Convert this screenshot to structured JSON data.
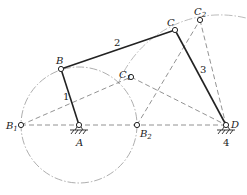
{
  "diagram": {
    "type": "four-bar linkage (crank-rocker) with extreme positions",
    "colors": {
      "link": "#222222",
      "construction": "#888888",
      "circle": "#999999"
    },
    "points": {
      "A": {
        "label": "A",
        "x": 79,
        "y": 125
      },
      "B": {
        "label": "B",
        "x": 61,
        "y": 69
      },
      "B1": {
        "label": "B",
        "sub": "1",
        "x": 21,
        "y": 125
      },
      "B2": {
        "label": "B",
        "sub": "2",
        "x": 137,
        "y": 125
      },
      "C": {
        "label": "C",
        "x": 175,
        "y": 30
      },
      "C1": {
        "label": "C",
        "sub": "1",
        "x": 131,
        "y": 77
      },
      "C2": {
        "label": "C",
        "sub": "2",
        "x": 200,
        "y": 20
      },
      "D": {
        "label": "D",
        "x": 226,
        "y": 125
      }
    },
    "links": [
      {
        "id": "1",
        "label": "1",
        "from": "A",
        "to": "B"
      },
      {
        "id": "2",
        "label": "2",
        "from": "B",
        "to": "C"
      },
      {
        "id": "3",
        "label": "3",
        "from": "C",
        "to": "D"
      },
      {
        "id": "4",
        "label": "4",
        "note": "frame at D"
      }
    ],
    "construction_lines": [
      [
        "B1",
        "D"
      ],
      [
        "B1",
        "C1"
      ],
      [
        "C1",
        "D"
      ],
      [
        "B2",
        "C2"
      ],
      [
        "C2",
        "D"
      ]
    ],
    "crank_circle": {
      "center": "A",
      "radius": 58
    },
    "rocker_arc": {
      "center": "D",
      "through": [
        "C1",
        "C",
        "C2"
      ]
    }
  }
}
